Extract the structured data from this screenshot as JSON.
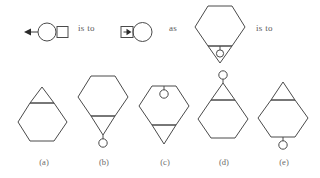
{
  "puzzle": {
    "type": "visual-analogy-multiple-choice",
    "connectors": {
      "is_to_1": "is to",
      "as": "as",
      "is_to_2": "is to"
    },
    "prompt_row": {
      "term_a": {
        "name": "circle-with-left-arrow-and-right-square",
        "shapes": [
          "left-arrow",
          "circle",
          "square"
        ],
        "arrow_direction": "left",
        "arrow_position": "left-of-circle",
        "square_position": "right-of-circle"
      },
      "term_b": {
        "name": "square-with-right-arrow-and-right-circle",
        "shapes": [
          "square",
          "right-arrow",
          "circle"
        ],
        "arrow_direction": "right",
        "arrow_position": "inside-square",
        "square_position": "left-of-circle"
      },
      "term_c": {
        "name": "hexagon-with-bottom-triangle-and-inner-circle",
        "shapes": [
          "hexagon",
          "down-triangle",
          "circle"
        ],
        "triangle_direction": "down",
        "triangle_position": "below-hexagon",
        "circle_position": "inside-triangle"
      }
    },
    "options": [
      {
        "id": "a",
        "label": "(a)",
        "name": "hexagon-with-top-triangle",
        "shapes": [
          "hexagon",
          "up-triangle"
        ],
        "triangle_direction": "up",
        "triangle_position": "top-overlapping-hexagon",
        "circle": "none"
      },
      {
        "id": "b",
        "label": "(b)",
        "name": "hexagon-with-bottom-triangle-and-hanging-circle",
        "shapes": [
          "hexagon",
          "down-triangle",
          "circle"
        ],
        "triangle_direction": "down",
        "triangle_position": "below-hexagon",
        "circle_position": "below-triangle-apex"
      },
      {
        "id": "c",
        "label": "(c)",
        "name": "hexagon-with-inner-top-circle-and-bottom-triangle",
        "shapes": [
          "hexagon",
          "circle",
          "down-triangle"
        ],
        "triangle_direction": "down",
        "triangle_position": "below-hexagon",
        "circle_position": "inside-hexagon-top"
      },
      {
        "id": "d",
        "label": "(d)",
        "name": "hexagon-with-top-triangle-and-circle-above",
        "shapes": [
          "hexagon",
          "up-triangle",
          "circle"
        ],
        "triangle_direction": "up",
        "triangle_position": "top-overlapping-hexagon",
        "circle_position": "above-triangle-apex"
      },
      {
        "id": "e",
        "label": "(e)",
        "name": "hexagon-with-top-triangle-and-circle-below",
        "shapes": [
          "hexagon",
          "up-triangle",
          "circle"
        ],
        "triangle_direction": "up",
        "triangle_position": "top-overlapping-hexagon",
        "circle_position": "below-hexagon-bottom"
      }
    ],
    "colors": {
      "stroke": "#4a4a4a",
      "text": "#5a5a5a",
      "background": "#ffffff"
    }
  }
}
